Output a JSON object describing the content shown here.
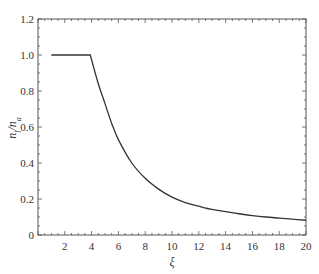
{
  "chart_data": {
    "type": "line",
    "title": "",
    "xlabel": "ξ",
    "ylabel": "n_l/n_a",
    "xlim": [
      0,
      20
    ],
    "ylim": [
      0,
      1.2
    ],
    "xticks": [
      2,
      4,
      6,
      8,
      10,
      12,
      14,
      16,
      18,
      20
    ],
    "xtick_labels": [
      "2",
      "4",
      "6",
      "8",
      "10",
      "12",
      "14",
      "16",
      "18",
      "20"
    ],
    "yticks": [
      0,
      0.2,
      0.4,
      0.6,
      0.8,
      1.0,
      1.2
    ],
    "ytick_labels": [
      "0",
      "0.2",
      "0.4",
      "0.6",
      "0.8",
      "1.0",
      "1.2"
    ],
    "grid": false,
    "legend": null,
    "series": [
      {
        "name": "n_l/n_a",
        "color": "#333333",
        "x": [
          1.0,
          2.0,
          3.0,
          3.9,
          4.5,
          5.0,
          5.5,
          6.0,
          7.0,
          8.0,
          9.0,
          10.0,
          11.0,
          12.0,
          13.0,
          14.0,
          15.0,
          16.0,
          17.0,
          18.0,
          19.0,
          20.0
        ],
        "y": [
          1.0,
          1.0,
          1.0,
          1.0,
          0.84,
          0.73,
          0.62,
          0.53,
          0.4,
          0.315,
          0.255,
          0.21,
          0.18,
          0.16,
          0.142,
          0.13,
          0.118,
          0.108,
          0.1,
          0.094,
          0.088,
          0.082
        ]
      }
    ]
  }
}
